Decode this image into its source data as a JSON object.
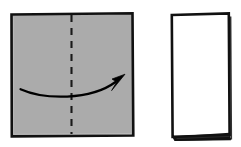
{
  "diagram": {
    "title": "Paper folding step diagram",
    "type": "origami-fold-instruction",
    "canvas": {
      "width": 241,
      "height": 147,
      "background": "#ffffff"
    },
    "colors": {
      "paper_gray": "#ababab",
      "paper_white": "#ffffff",
      "outline": "#111111",
      "fold_line": "#1a1a1a",
      "arrow": "#000000"
    },
    "steps": [
      {
        "index": 1,
        "name": "before-fold",
        "shape_name": "gray-square-sheet",
        "shape_kind": "square",
        "fill": "#ababab",
        "stroke": "#111111",
        "stroke_width": 2.6,
        "bounds": {
          "x": 11,
          "y": 13,
          "width": 122,
          "height": 123
        },
        "annotation": "Square sheet of paper, gray side up"
      },
      {
        "index": 2,
        "name": "after-fold",
        "shape_name": "white-folded-rectangle",
        "shape_kind": "rectangle",
        "fill": "#ffffff",
        "stroke": "#111111",
        "stroke_width": 2.6,
        "bounds": {
          "x": 171,
          "y": 13,
          "width": 58,
          "height": 123
        },
        "annotation": "Result: paper folded in half vertically, white side showing"
      }
    ],
    "fold_line": {
      "name": "vertical-fold-crease",
      "style": "dashed",
      "orientation": "vertical",
      "x": 71.5,
      "y_start": 15,
      "y_end": 134,
      "dash_pattern": "7 6",
      "stroke_width": 2.1,
      "color": "#1a1a1a",
      "label": "fold here"
    },
    "arrow": {
      "name": "fold-direction-arrow",
      "direction": "left-to-right",
      "curve": "shallow downward bow",
      "path": "M 20.5 89.5 C 45 99.5, 92 100.5, 118 80.5",
      "head_tip": {
        "x": 124,
        "y": 75.5
      },
      "stroke_width": 2.2,
      "color": "#000000",
      "label": "fold the left half over to the right"
    },
    "fold_edge_wedge": {
      "name": "folded-edge-wedge",
      "description": "thin dark double-layer sliver along the bottom open edge of the folded sheet",
      "color": "#111111",
      "points": "172,136.5 229.5,132.8 231,140.2 174.5,141"
    }
  }
}
